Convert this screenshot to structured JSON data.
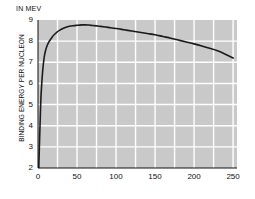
{
  "chart_data": {
    "type": "line",
    "title": "",
    "unit_label": "IN MEV",
    "xlabel": "MASS NUMBER",
    "ylabel": "BINDING ENERGY PER NUCLEON",
    "xlim": [
      0,
      255
    ],
    "ylim": [
      2,
      9
    ],
    "xticks": [
      0,
      50,
      100,
      150,
      200,
      250
    ],
    "yticks": [
      2,
      3,
      4,
      5,
      6,
      7,
      8,
      9
    ],
    "xtick_labels": [
      "0",
      "50",
      "100",
      "150",
      "200",
      "250"
    ],
    "ytick_labels": [
      "2",
      "3",
      "4",
      "5",
      "6",
      "7",
      "8",
      "9"
    ],
    "grid": true,
    "grid_color": "#ffffff",
    "grid_minor_x_step": 25,
    "grid_major_y_step": 1,
    "plot_background": "#c9c9c9",
    "page_background": "#ffffff",
    "legend": "none",
    "series": [
      {
        "name": "Binding energy per nucleon",
        "color": "#1a1a1a",
        "line_width": 1.6,
        "x": [
          1,
          2,
          3,
          4,
          6,
          8,
          10,
          12,
          14,
          16,
          18,
          20,
          24,
          28,
          32,
          36,
          40,
          45,
          50,
          56,
          60,
          65,
          70,
          75,
          80,
          90,
          100,
          110,
          120,
          130,
          140,
          150,
          160,
          170,
          180,
          190,
          200,
          210,
          220,
          230,
          240,
          250
        ],
        "y": [
          2.0,
          3.3,
          4.5,
          5.5,
          6.6,
          7.25,
          7.6,
          7.82,
          7.97,
          8.08,
          8.18,
          8.28,
          8.42,
          8.52,
          8.6,
          8.66,
          8.7,
          8.73,
          8.75,
          8.77,
          8.77,
          8.76,
          8.74,
          8.72,
          8.7,
          8.65,
          8.6,
          8.54,
          8.48,
          8.42,
          8.36,
          8.3,
          8.22,
          8.14,
          8.05,
          7.96,
          7.87,
          7.77,
          7.66,
          7.54,
          7.38,
          7.2
        ]
      }
    ],
    "annotations": []
  }
}
